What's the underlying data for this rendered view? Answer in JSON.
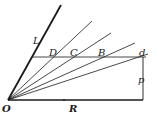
{
  "diagram": {
    "type": "geometric-vector-figure",
    "colors": {
      "ink": "#1a1a1a",
      "background": "#ffffff"
    },
    "points": {
      "O": {
        "label": "O",
        "x": 8,
        "y": 100
      },
      "L_end": {
        "x": 61,
        "y": 5
      },
      "D": {
        "label": "D"
      },
      "C": {
        "label": "C"
      },
      "B": {
        "label": "B"
      },
      "d": {
        "label": "d"
      }
    },
    "labels": {
      "L": "L",
      "D": "D",
      "C": "C",
      "B": "B",
      "d": "d",
      "p": "p",
      "O": "O",
      "R": "R"
    },
    "lines": [
      {
        "name": "line-L",
        "from": "O",
        "to": [
          61,
          5
        ],
        "weight": "heavy"
      },
      {
        "name": "ray-D",
        "from": "O",
        "to": [
          92,
          21
        ]
      },
      {
        "name": "ray-C",
        "from": "O",
        "to": [
          111,
          33
        ]
      },
      {
        "name": "ray-B",
        "from": "O",
        "to": [
          135,
          43
        ]
      },
      {
        "name": "ray-d",
        "from": "O",
        "to": [
          148,
          54
        ]
      },
      {
        "name": "horizontal-line",
        "from": [
          32,
          57
        ],
        "to": [
          146,
          57
        ]
      },
      {
        "name": "line-p",
        "from": [
          143,
          57
        ],
        "to": [
          143,
          100
        ]
      },
      {
        "name": "line-R",
        "from": "O",
        "to": [
          143,
          100
        ],
        "weight": "heavy"
      }
    ]
  }
}
